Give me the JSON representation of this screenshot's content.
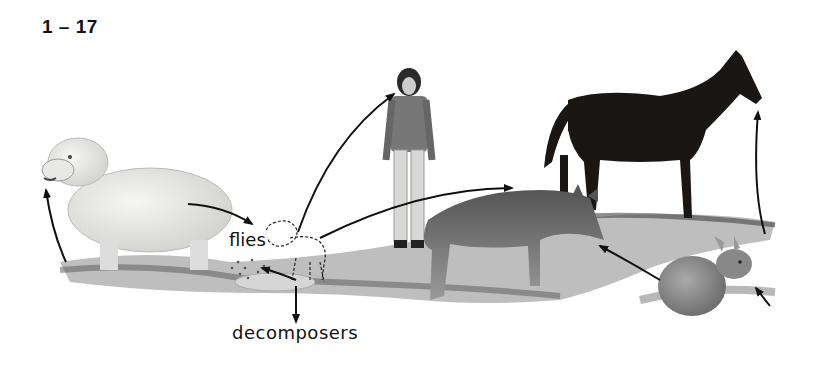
{
  "figure": {
    "label": "1 – 17",
    "type": "food-chain-illustration",
    "nodes": [
      {
        "id": "grass",
        "name": "grass"
      },
      {
        "id": "sheep",
        "name": "sheep"
      },
      {
        "id": "lamb",
        "name": "lamb (outline)"
      },
      {
        "id": "dead-lamb",
        "name": "dead lamb"
      },
      {
        "id": "woman",
        "name": "woman"
      },
      {
        "id": "coyote",
        "name": "coyote"
      },
      {
        "id": "horse",
        "name": "horse"
      },
      {
        "id": "rabbit",
        "name": "rabbit"
      }
    ],
    "labels": {
      "flies": "flies",
      "decomposers": "decomposers"
    },
    "arrows": [
      {
        "from": "grass",
        "to": "sheep"
      },
      {
        "from": "sheep",
        "to": "lamb"
      },
      {
        "from": "lamb",
        "to": "woman"
      },
      {
        "from": "lamb",
        "to": "coyote"
      },
      {
        "from": "lamb",
        "to": "dead-lamb"
      },
      {
        "from": "dead-lamb",
        "to": "decomposers"
      },
      {
        "from": "grass",
        "to": "horse"
      },
      {
        "from": "grass",
        "to": "rabbit"
      },
      {
        "from": "rabbit",
        "to": "coyote"
      }
    ],
    "colors": {
      "ink": "#111111",
      "background": "#ffffff",
      "horse": "#1a1614",
      "grass": "#7a7a7a"
    }
  }
}
